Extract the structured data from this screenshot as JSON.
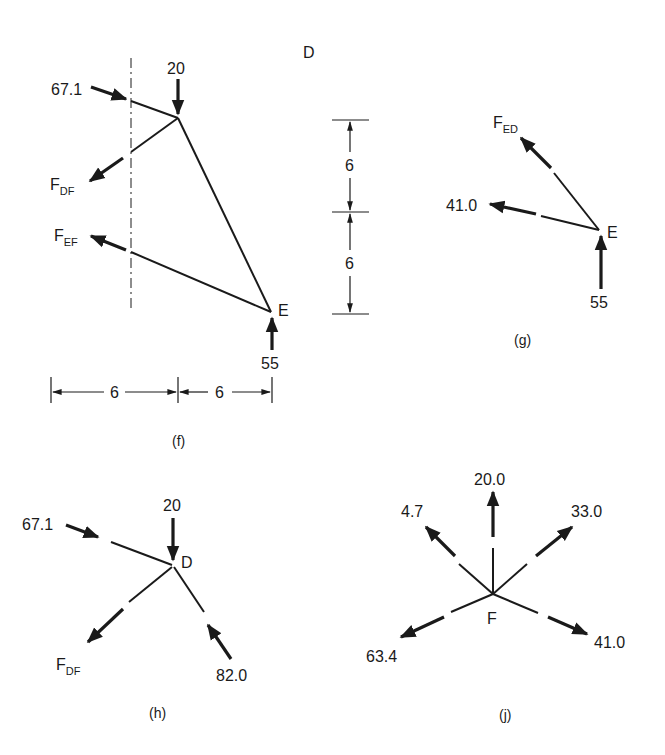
{
  "panels": {
    "f": {
      "caption": "(f)",
      "node_D": "D",
      "node_E": "E",
      "force_top_left": "67.1",
      "force_top": "20",
      "force_bottom": "55",
      "F_DF_main": "F",
      "F_DF_sub": "DF",
      "F_EF_main": "F",
      "F_EF_sub": "EF",
      "dim_h1": "6",
      "dim_h2": "6",
      "dim_v1": "6",
      "dim_v2": "6"
    },
    "g": {
      "caption": "(g)",
      "node_E": "E",
      "F_ED_main": "F",
      "F_ED_sub": "ED",
      "force_left": "41.0",
      "force_bottom": "55"
    },
    "h": {
      "caption": "(h)",
      "node_D": "D",
      "force_left": "67.1",
      "force_top": "20",
      "force_bottom_right": "82.0",
      "F_DF_main": "F",
      "F_DF_sub": "DF"
    },
    "j": {
      "caption": "(j)",
      "node_F": "F",
      "force_up": "20.0",
      "force_up_left": "4.7",
      "force_up_right": "33.0",
      "force_down_left": "63.4",
      "force_down_right": "41.0"
    }
  }
}
